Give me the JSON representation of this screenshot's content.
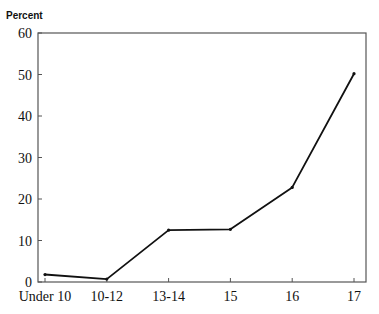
{
  "chart_data": {
    "type": "line",
    "title": "",
    "xlabel": "",
    "ylabel": "Percent",
    "categories": [
      "Under 10",
      "10-12",
      "13-14",
      "15",
      "16",
      "17"
    ],
    "series": [
      {
        "name": "Percent",
        "values": [
          1.8,
          0.7,
          12.5,
          12.7,
          22.8,
          50.2
        ]
      }
    ],
    "ylim": [
      0,
      60
    ],
    "yticks": [
      0,
      10,
      20,
      30,
      40,
      50,
      60
    ],
    "grid": false,
    "legend": "none",
    "colors": {
      "line": "#111111",
      "axis": "#555555"
    }
  }
}
